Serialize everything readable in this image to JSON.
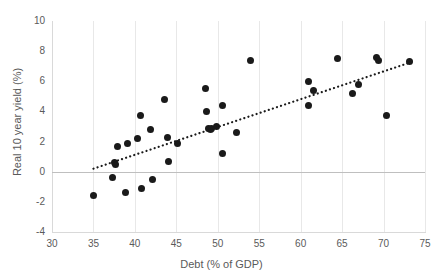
{
  "chart_data": {
    "type": "scatter",
    "title": "",
    "xlabel": "Debt (% of GDP)",
    "ylabel": "Real 10 year yield (%)",
    "xlim": [
      30,
      75
    ],
    "ylim": [
      -4,
      10
    ],
    "xticks": [
      30,
      35,
      40,
      45,
      50,
      55,
      60,
      65,
      70,
      75
    ],
    "yticks": [
      -4,
      -2,
      0,
      2,
      4,
      6,
      8,
      10
    ],
    "grid": "vertical-only",
    "legend": "none",
    "marker_color": "#1a1a1a",
    "gridline_color": "#e8e8e8",
    "zero_line_color": "#bfbfbf",
    "axis_text_color": "#5a5a5a",
    "points": [
      {
        "x": 35.0,
        "y": -1.6
      },
      {
        "x": 37.3,
        "y": -0.4
      },
      {
        "x": 37.6,
        "y": 0.6
      },
      {
        "x": 37.7,
        "y": 0.5
      },
      {
        "x": 37.9,
        "y": 1.7
      },
      {
        "x": 38.9,
        "y": -1.4
      },
      {
        "x": 39.1,
        "y": 1.9
      },
      {
        "x": 40.3,
        "y": 2.2
      },
      {
        "x": 40.7,
        "y": 3.7
      },
      {
        "x": 40.8,
        "y": -1.1
      },
      {
        "x": 41.9,
        "y": 2.8
      },
      {
        "x": 42.1,
        "y": -0.5
      },
      {
        "x": 43.6,
        "y": 4.8
      },
      {
        "x": 43.9,
        "y": 2.3
      },
      {
        "x": 44.0,
        "y": 0.7
      },
      {
        "x": 45.1,
        "y": 1.9
      },
      {
        "x": 48.5,
        "y": 5.5
      },
      {
        "x": 48.6,
        "y": 4.0
      },
      {
        "x": 48.9,
        "y": 2.9
      },
      {
        "x": 49.1,
        "y": 2.8
      },
      {
        "x": 49.3,
        "y": 2.9
      },
      {
        "x": 49.9,
        "y": 3.0
      },
      {
        "x": 50.6,
        "y": 4.4
      },
      {
        "x": 50.6,
        "y": 1.2
      },
      {
        "x": 52.2,
        "y": 2.6
      },
      {
        "x": 54.0,
        "y": 7.4
      },
      {
        "x": 60.9,
        "y": 4.4
      },
      {
        "x": 61.0,
        "y": 6.0
      },
      {
        "x": 61.6,
        "y": 5.4
      },
      {
        "x": 64.5,
        "y": 7.5
      },
      {
        "x": 66.3,
        "y": 5.2
      },
      {
        "x": 67.0,
        "y": 5.8
      },
      {
        "x": 69.2,
        "y": 7.6
      },
      {
        "x": 69.4,
        "y": 7.4
      },
      {
        "x": 70.3,
        "y": 3.7
      },
      {
        "x": 73.1,
        "y": 7.3
      }
    ],
    "trendline": {
      "type": "dotted",
      "color": "#1a1a1a",
      "x_start": 35.0,
      "y_start": 0.2,
      "x_end": 73.5,
      "y_end": 7.3
    }
  }
}
